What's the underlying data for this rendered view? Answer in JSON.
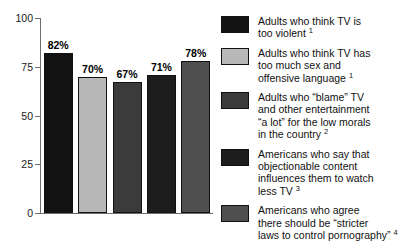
{
  "chart_data": {
    "type": "bar",
    "title": "",
    "xlabel": "",
    "ylabel": "",
    "ylim": [
      0,
      100
    ],
    "yticks": [
      "0",
      "25",
      "50",
      "75",
      "100"
    ],
    "grid": false,
    "legend_position": "right",
    "categories": [
      "Adults who think TV is too violent",
      "Adults who think TV has too much sex and offensive language",
      "Adults who \"blame\" TV and other entertainment \"a lot\" for the low morals in the country",
      "Americans who say that objectionable content influences them to watch less TV",
      "Americans who agree there should be \"stricter laws to control pornography\""
    ],
    "values": [
      82,
      70,
      67,
      71,
      78
    ],
    "data_labels": [
      "82%",
      "70%",
      "67%",
      "71%",
      "78%"
    ],
    "colors": [
      "#131313",
      "#b8b8b8",
      "#3b3b3b",
      "#1d1d1d",
      "#4f4f4f"
    ]
  },
  "axis": {
    "ticks": [
      {
        "label": "100",
        "value": 100
      },
      {
        "label": "75",
        "value": 75
      },
      {
        "label": "50",
        "value": 50
      },
      {
        "label": "25",
        "value": 25
      },
      {
        "label": "0",
        "value": 0
      }
    ]
  },
  "bars": [
    {
      "label": "82%",
      "value": 82,
      "color": "#131313"
    },
    {
      "label": "70%",
      "value": 70,
      "color": "#b8b8b8"
    },
    {
      "label": "67%",
      "value": 67,
      "color": "#3b3b3b"
    },
    {
      "label": "71%",
      "value": 71,
      "color": "#1d1d1d"
    },
    {
      "label": "78%",
      "value": 78,
      "color": "#4f4f4f"
    }
  ],
  "legend": {
    "items": [
      {
        "color": "#131313",
        "lines": [
          "Adults who think TV is",
          "too violent"
        ],
        "footnote": "1"
      },
      {
        "color": "#b8b8b8",
        "lines": [
          "Adults who think TV has",
          "too much sex and",
          "offensive language"
        ],
        "footnote": "1"
      },
      {
        "color": "#3b3b3b",
        "lines": [
          "Adults who “blame” TV",
          "and other entertainment",
          "“a lot” for the low morals",
          "in the country"
        ],
        "footnote": "2"
      },
      {
        "color": "#1d1d1d",
        "lines": [
          "Americans who say that",
          "objectionable content",
          "influences them to watch",
          "less TV"
        ],
        "footnote": "3"
      },
      {
        "color": "#4f4f4f",
        "lines": [
          "Americans who agree",
          "there should be “stricter",
          "laws to control pornography”"
        ],
        "footnote": "4"
      }
    ]
  }
}
